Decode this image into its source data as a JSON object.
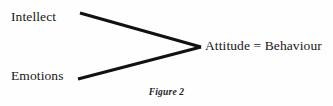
{
  "figure": {
    "caption": "Figure 2",
    "background_color": "#fefefe",
    "ink_color": "#111111"
  },
  "diagram": {
    "type": "converging-arrow-diagram",
    "inputs": [
      {
        "label": "Intellect"
      },
      {
        "label": "Emotions"
      }
    ],
    "output": {
      "label": "Attitude = Behaviour"
    },
    "connectors": [
      {
        "name": "intellect-to-attitude",
        "from": {
          "x": 80,
          "y": 13
        },
        "to": {
          "x": 201,
          "y": 47
        }
      },
      {
        "name": "emotions-to-attitude",
        "from": {
          "x": 78,
          "y": 79
        },
        "to": {
          "x": 201,
          "y": 47
        }
      }
    ]
  }
}
